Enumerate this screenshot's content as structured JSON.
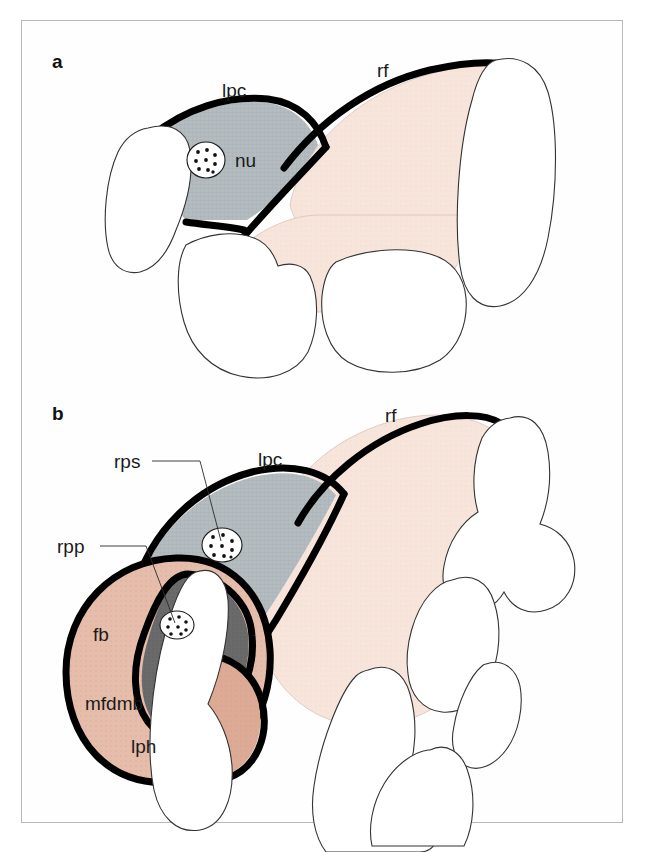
{
  "figure": {
    "domain_kind": "anatomical-schematic",
    "caption_letters": [
      "a",
      "b"
    ],
    "background_color": "#ffffff",
    "frame_color": "#b9b9b9"
  },
  "colors": {
    "outline_black": "#000000",
    "lpc_gray": "#b4bcc0",
    "rf_pink": "#f7e5db",
    "fb_salmon": "#e6bcab",
    "mfdmb_dark_gray": "#6a6a6a",
    "lph_tan": "#ddab95",
    "cartilage_white": "#ffffff",
    "speckle_gray": "#8e9296",
    "leader_gray": "#2b2b2b"
  },
  "panels": [
    {
      "id": "a",
      "letter": "a",
      "letter_pos": {
        "x": 52,
        "y": 68
      },
      "labels": [
        {
          "key": "lpc",
          "text": "lpc",
          "x": 222,
          "y": 97,
          "leader": false
        },
        {
          "key": "rf",
          "text": "rf",
          "x": 377,
          "y": 77,
          "leader": false
        },
        {
          "key": "nu",
          "text": "nu",
          "x": 235,
          "y": 163,
          "leader": false
        }
      ],
      "regions": [
        {
          "key": "lpc",
          "fill": "lpc_gray",
          "label": "lpc"
        },
        {
          "key": "rf",
          "fill": "rf_pink",
          "label": "rf"
        }
      ],
      "markers": [
        {
          "key": "nu",
          "cx": 206,
          "cy": 160,
          "rx": 19,
          "ry": 18,
          "dots": 9
        }
      ],
      "cartilage_count": 4
    },
    {
      "id": "b",
      "letter": "b",
      "letter_pos": {
        "x": 52,
        "y": 420
      },
      "labels": [
        {
          "key": "rf",
          "text": "rf",
          "x": 385,
          "y": 422,
          "leader": false
        },
        {
          "key": "lpc",
          "text": "lpc",
          "x": 258,
          "y": 466,
          "leader": false
        },
        {
          "key": "rps",
          "text": "rps",
          "x": 114,
          "y": 468,
          "leader": true
        },
        {
          "key": "rpp",
          "text": "rpp",
          "x": 57,
          "y": 553,
          "leader": true
        },
        {
          "key": "fb",
          "text": "fb",
          "x": 93,
          "y": 641,
          "leader": false
        },
        {
          "key": "mfdmb",
          "text": "mfdmb",
          "x": 85,
          "y": 710,
          "leader": false
        },
        {
          "key": "lph",
          "text": "lph",
          "x": 131,
          "y": 753,
          "leader": false
        }
      ],
      "leaders": [
        {
          "key": "rps",
          "points": "152,461 200,461 221,541"
        },
        {
          "key": "rpp",
          "points": "100,546 146,546 175,623"
        }
      ],
      "regions": [
        {
          "key": "lpc",
          "fill": "lpc_gray",
          "label": "lpc"
        },
        {
          "key": "rf",
          "fill": "rf_pink",
          "label": "rf"
        },
        {
          "key": "fb",
          "fill": "fb_salmon",
          "label": "fb"
        },
        {
          "key": "mfdmb",
          "fill": "mfdmb_dark_gray",
          "label": "mfdmb"
        },
        {
          "key": "lph",
          "fill": "lph_tan",
          "label": "lph"
        }
      ],
      "markers": [
        {
          "key": "rps",
          "cx": 222,
          "cy": 545,
          "rx": 20,
          "ry": 17,
          "dots": 9
        },
        {
          "key": "rpp",
          "cx": 177,
          "cy": 625,
          "rx": 17,
          "ry": 14,
          "dots": 8
        }
      ],
      "cartilage_count": 6
    }
  ],
  "abbreviations": {
    "lpc": "lpc",
    "rf": "rf",
    "nu": "nu",
    "rps": "rps",
    "rpp": "rpp",
    "fb": "fb",
    "mfdmb": "mfdmb",
    "lph": "lph"
  }
}
